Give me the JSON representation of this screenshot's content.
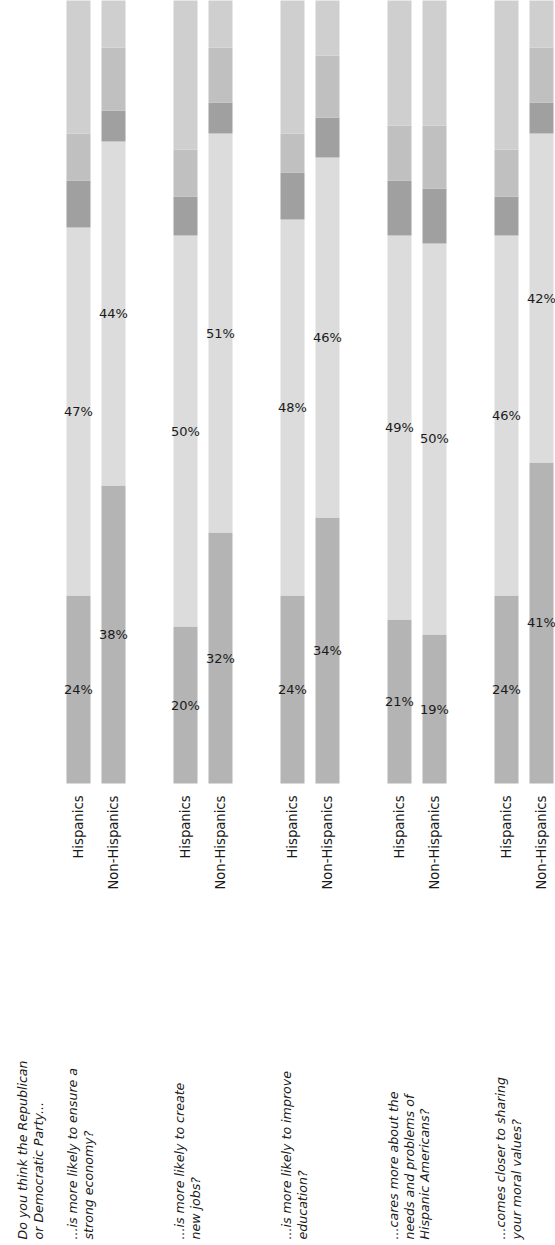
{
  "header_note": "Do you think the Republican\nor Democratic Party...",
  "axis": {
    "categories": [
      "Republican",
      "Democratic",
      "Both",
      "Neither",
      "No opinion"
    ],
    "tick_positions": [
      12,
      48,
      80,
      87,
      94
    ]
  },
  "colors": {
    "republican": "#b4b4b4",
    "democratic": "#dcdcdc",
    "both": "#a0a0a0",
    "neither": "#c0c0c0",
    "no_opinion": "#cfcfcf",
    "text": "#1a1a1a",
    "background": "#ffffff"
  },
  "series_names": [
    "Hispanics",
    "Non-Hispanics"
  ],
  "chart_data": {
    "type": "bar",
    "title": "Do you think the Republican or Democratic Party...",
    "xlabel": "",
    "ylabel": "",
    "xlim": [
      0,
      100
    ],
    "grid": false,
    "legend_position": "axis-top",
    "stacked": true,
    "stack_percent": true,
    "segments": [
      "Republican",
      "Democratic",
      "Both",
      "Neither",
      "No opinion"
    ],
    "groups": [
      {
        "question": "...is more likely to ensure a\nstrong economy?",
        "rows": [
          {
            "name": "Hispanics",
            "values": [
              24,
              47,
              6,
              6,
              17
            ],
            "labels": [
              "24%",
              "47%",
              "",
              "",
              ""
            ]
          },
          {
            "name": "Non-Hispanics",
            "values": [
              38,
              44,
              4,
              8,
              6
            ],
            "labels": [
              "38%",
              "44%",
              "",
              "",
              ""
            ]
          }
        ]
      },
      {
        "question": "...is more likely to create\nnew jobs?",
        "rows": [
          {
            "name": "Hispanics",
            "values": [
              20,
              50,
              5,
              6,
              19
            ],
            "labels": [
              "20%",
              "50%",
              "",
              "",
              ""
            ]
          },
          {
            "name": "Non-Hispanics",
            "values": [
              32,
              51,
              4,
              7,
              6
            ],
            "labels": [
              "32%",
              "51%",
              "",
              "",
              ""
            ]
          }
        ]
      },
      {
        "question": "...is more likely to improve\neducation?",
        "rows": [
          {
            "name": "Hispanics",
            "values": [
              24,
              48,
              6,
              5,
              17
            ],
            "labels": [
              "24%",
              "48%",
              "",
              "",
              ""
            ]
          },
          {
            "name": "Non-Hispanics",
            "values": [
              34,
              46,
              5,
              8,
              7
            ],
            "labels": [
              "34%",
              "46%",
              "",
              "",
              ""
            ]
          }
        ]
      },
      {
        "question": "...cares more about the\nneeds and problems of\nHispanic Americans?",
        "rows": [
          {
            "name": "Hispanics",
            "values": [
              21,
              49,
              7,
              7,
              16
            ],
            "labels": [
              "21%",
              "49%",
              "",
              "",
              ""
            ]
          },
          {
            "name": "Non-Hispanics",
            "values": [
              19,
              50,
              7,
              8,
              16
            ],
            "labels": [
              "19%",
              "50%",
              "",
              "",
              ""
            ]
          }
        ]
      },
      {
        "question": "...comes closer to sharing\nyour moral values?",
        "rows": [
          {
            "name": "Hispanics",
            "values": [
              24,
              46,
              5,
              6,
              19
            ],
            "labels": [
              "24%",
              "46%",
              "",
              "",
              ""
            ]
          },
          {
            "name": "Non-Hispanics",
            "values": [
              41,
              42,
              4,
              7,
              6
            ],
            "labels": [
              "41%",
              "42%",
              "",
              "",
              ""
            ]
          }
        ]
      }
    ]
  }
}
